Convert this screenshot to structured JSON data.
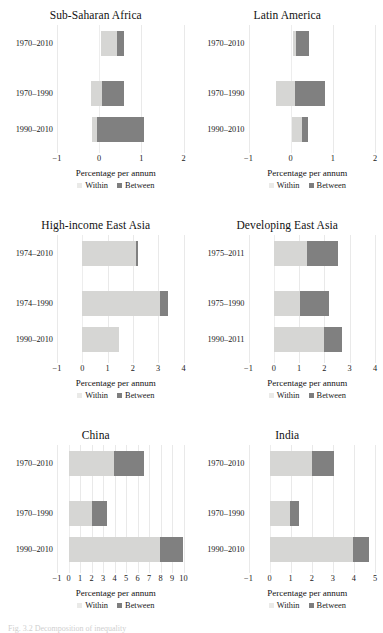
{
  "figure": {
    "caption": "Fig. 3.2  Decomposition of inequality",
    "legend": {
      "within": "Within",
      "between": "Between"
    },
    "axis_title": "Percentage per annum",
    "colors": {
      "within": "#d6d6d4",
      "between": "#808080",
      "grid": "#e9e9e9"
    }
  },
  "chart_data": [
    {
      "type": "bar",
      "title": "Sub-Saharan Africa",
      "xlabel": "Percentage per annum",
      "ylabel": "",
      "xlim": [
        -1,
        2
      ],
      "ticks": [
        "−1",
        "0",
        "1",
        "2"
      ],
      "grid": true,
      "orientation": "horizontal",
      "stacked": true,
      "legend": [
        "Within",
        "Between"
      ],
      "categories": [
        "1970–2010",
        "1970–1990",
        "1990–2010"
      ],
      "series": [
        {
          "name": "Within",
          "values": [
            0.38,
            0.58,
            -0.18
          ]
        },
        {
          "name": "Between",
          "values": [
            0.17,
            0.52,
            1.12
          ]
        }
      ],
      "bars": [
        {
          "category": "1970–2010",
          "within_start": 0.05,
          "within_end": 0.43,
          "between_start": 0.43,
          "between_end": 0.6
        },
        {
          "category": "1970–1990",
          "within_start": -0.2,
          "within_end": 0.06,
          "between_start": 0.06,
          "between_end": 0.58
        },
        {
          "category": "1990–2010",
          "within_start": -0.17,
          "within_end": -0.05,
          "between_start": -0.05,
          "between_end": 1.07
        }
      ]
    },
    {
      "type": "bar",
      "title": "Latin America",
      "xlabel": "Percentage per annum",
      "ylabel": "",
      "xlim": [
        -1,
        2
      ],
      "ticks": [
        "−1",
        "0",
        "1",
        "2"
      ],
      "grid": true,
      "orientation": "horizontal",
      "stacked": true,
      "legend": [
        "Within",
        "Between"
      ],
      "categories": [
        "1970–2010",
        "1970–1990",
        "1990–2010"
      ],
      "series": [
        {
          "name": "Within",
          "values": [
            0.08,
            0.44,
            0.25
          ]
        },
        {
          "name": "Between",
          "values": [
            0.3,
            0.72,
            0.15
          ]
        }
      ],
      "bars": [
        {
          "category": "1970–2010",
          "within_start": 0.05,
          "within_end": 0.13,
          "between_start": 0.13,
          "between_end": 0.43
        },
        {
          "category": "1970–1990",
          "within_start": -0.34,
          "within_end": 0.1,
          "between_start": 0.1,
          "between_end": 0.82
        },
        {
          "category": "1990–2010",
          "within_start": 0.02,
          "within_end": 0.27,
          "between_start": 0.27,
          "between_end": 0.42
        }
      ]
    },
    {
      "type": "bar",
      "title": "High-income East Asia",
      "xlabel": "Percentage per annum",
      "ylabel": "",
      "xlim": [
        -1,
        4
      ],
      "ticks": [
        "−1",
        "0",
        "1",
        "2",
        "3",
        "4"
      ],
      "grid": true,
      "orientation": "horizontal",
      "stacked": true,
      "legend": [
        "Within",
        "Between"
      ],
      "categories": [
        "1974–2010",
        "1974–1990",
        "1990–2010"
      ],
      "series": [
        {
          "name": "Within",
          "values": [
            2.12,
            3.1,
            1.45
          ]
        },
        {
          "name": "Between",
          "values": [
            0.1,
            0.3,
            0.0
          ]
        }
      ],
      "bars": [
        {
          "category": "1974–2010",
          "within_start": 0.0,
          "within_end": 2.12,
          "between_start": 2.12,
          "between_end": 2.22
        },
        {
          "category": "1974–1990",
          "within_start": 0.0,
          "within_end": 3.08,
          "between_start": 3.08,
          "between_end": 3.38
        },
        {
          "category": "1990–2010",
          "within_start": 0.0,
          "within_end": 1.45,
          "between_start": 1.45,
          "between_end": 1.45
        }
      ]
    },
    {
      "type": "bar",
      "title": "Developing East Asia",
      "xlabel": "Percentage per annum",
      "ylabel": "",
      "xlim": [
        -1,
        4
      ],
      "ticks": [
        "−1",
        "0",
        "1",
        "2",
        "3",
        "4"
      ],
      "grid": true,
      "orientation": "horizontal",
      "stacked": true,
      "legend": [
        "Within",
        "Between"
      ],
      "categories": [
        "1975–2011",
        "1975–1990",
        "1990–2011"
      ],
      "series": [
        {
          "name": "Within",
          "values": [
            1.3,
            1.05,
            2.0
          ]
        },
        {
          "name": "Between",
          "values": [
            1.25,
            1.15,
            0.7
          ]
        }
      ],
      "bars": [
        {
          "category": "1975–2011",
          "within_start": 0.0,
          "within_end": 1.3,
          "between_start": 1.3,
          "between_end": 2.55
        },
        {
          "category": "1975–1990",
          "within_start": 0.0,
          "within_end": 1.05,
          "between_start": 1.05,
          "between_end": 2.2
        },
        {
          "category": "1990–2011",
          "within_start": 0.0,
          "within_end": 2.0,
          "between_start": 2.0,
          "between_end": 2.7
        }
      ]
    },
    {
      "type": "bar",
      "title": "China",
      "xlabel": "Percentage per annum",
      "ylabel": "",
      "xlim": [
        -1,
        10
      ],
      "ticks": [
        "−1",
        "0",
        "1",
        "2",
        "3",
        "4",
        "5",
        "6",
        "7",
        "8",
        "9",
        "10"
      ],
      "grid": true,
      "orientation": "horizontal",
      "stacked": true,
      "legend": [
        "Within",
        "Between"
      ],
      "categories": [
        "1970–2010",
        "1970–1990",
        "1990–2010"
      ],
      "series": [
        {
          "name": "Within",
          "values": [
            3.95,
            2.05,
            7.95
          ]
        },
        {
          "name": "Between",
          "values": [
            2.65,
            1.3,
            2.05
          ]
        }
      ],
      "bars": [
        {
          "category": "1970–2010",
          "within_start": 0.0,
          "within_end": 3.95,
          "between_start": 3.95,
          "between_end": 6.6
        },
        {
          "category": "1970–1990",
          "within_start": 0.0,
          "within_end": 2.05,
          "between_start": 2.05,
          "between_end": 3.35
        },
        {
          "category": "1990–2010",
          "within_start": 0.0,
          "within_end": 7.95,
          "between_start": 7.95,
          "between_end": 10.0
        }
      ]
    },
    {
      "type": "bar",
      "title": "India",
      "xlabel": "Percentage per annum",
      "ylabel": "",
      "xlim": [
        -1,
        5
      ],
      "ticks": [
        "−1",
        "0",
        "1",
        "2",
        "3",
        "4",
        "5"
      ],
      "grid": true,
      "orientation": "horizontal",
      "stacked": true,
      "legend": [
        "Within",
        "Between"
      ],
      "categories": [
        "1970–2010",
        "1970–1990",
        "1990–2010"
      ],
      "series": [
        {
          "name": "Within",
          "values": [
            2.02,
            0.95,
            3.95
          ]
        },
        {
          "name": "Between",
          "values": [
            1.05,
            0.45,
            0.75
          ]
        }
      ],
      "bars": [
        {
          "category": "1970–2010",
          "within_start": 0.0,
          "within_end": 2.02,
          "between_start": 2.02,
          "between_end": 3.07
        },
        {
          "category": "1970–1990",
          "within_start": 0.0,
          "within_end": 0.95,
          "between_start": 0.95,
          "between_end": 1.4
        },
        {
          "category": "1990–2010",
          "within_start": 0.0,
          "within_end": 3.95,
          "between_start": 3.95,
          "between_end": 4.7
        }
      ]
    }
  ]
}
